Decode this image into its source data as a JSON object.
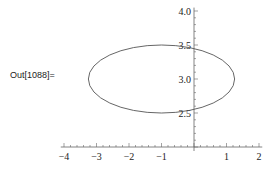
{
  "cell": {
    "output_label": "Out[1088]="
  },
  "chart_data": {
    "type": "line",
    "title": "",
    "xlabel": "",
    "ylabel": "",
    "shape": {
      "kind": "ellipse",
      "center": [
        -1,
        3
      ],
      "rx": 2.25,
      "ry": 0.5
    },
    "xlim": [
      -4.1,
      2.1
    ],
    "ylim": [
      2.0,
      4.05
    ],
    "axis_origin": [
      0,
      2
    ],
    "x_ticks": [
      "-4",
      "-3",
      "-2",
      "-1",
      "1",
      "2"
    ],
    "y_ticks": [
      "2.5",
      "3.0",
      "3.5",
      "4.0"
    ],
    "grid": false,
    "line_color": "#555555"
  }
}
